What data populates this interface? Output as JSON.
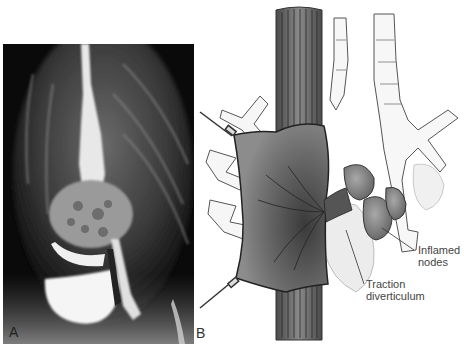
{
  "figure": {
    "panels": [
      {
        "id": "A",
        "label": "A",
        "type": "radiograph",
        "description": "Barium esophagram showing contrast-filled esophagus with outpouching (diverticulum)"
      },
      {
        "id": "B",
        "label": "B",
        "type": "illustration",
        "description": "Esophagus retracted with traction diverticulum pulled toward inflamed mediastinal lymph nodes"
      }
    ],
    "annotations": [
      {
        "text_line1": "Inflamed",
        "text_line2": "nodes"
      },
      {
        "text_line1": "Traction",
        "text_line2": "diverticulum"
      }
    ],
    "colors": {
      "xray_background": "#0a0a0a",
      "xray_contrast": "#f2f2f2",
      "esophagus_fill": "#6e6e6e",
      "retractor_fill": "#7a7a7a",
      "node_fill": "#8a8a8a",
      "airway_fill": "#f5f5f5",
      "line_color": "#333333",
      "label_color": "#444444"
    }
  }
}
